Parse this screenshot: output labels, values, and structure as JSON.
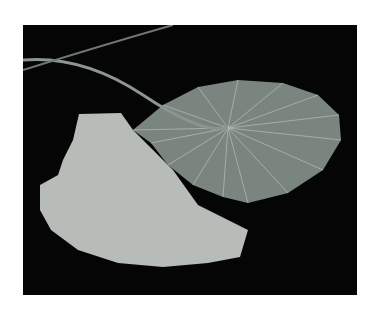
{
  "image": {
    "subject": "two water lily leaves on dark water",
    "background_color": "#050505",
    "frame_color": "#ffffff",
    "leaves": [
      {
        "name": "back-leaf-underside",
        "color": "#7f8a84",
        "vein_color": "#c9d0cb"
      },
      {
        "name": "front-leaf-top",
        "color": "#b9beba"
      }
    ],
    "stem_color": "#8d958f"
  }
}
